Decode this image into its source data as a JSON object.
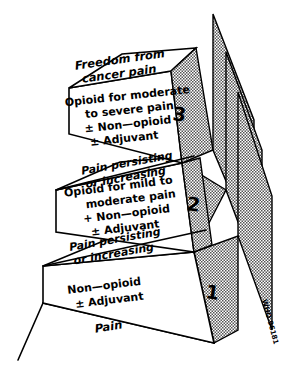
{
  "figure": {
    "goal_label_line1": "Freedom from",
    "goal_label_line2": "cancer pain",
    "base_label": "Pain",
    "credit": "WHO 96181",
    "ink_color": "#000000",
    "paper_color": "#ffffff",
    "shade_color": "#7a7a7a"
  },
  "transitions": [
    {
      "id": "transition-step2",
      "line1": "Pain persisting",
      "line2": "or increasing"
    },
    {
      "id": "transition-step1",
      "line1": "Pain persisting",
      "line2": "or increasing"
    }
  ],
  "steps": [
    {
      "number": "1",
      "name": "step-one",
      "lines": [
        "Non—opioid",
        "± Adjuvant"
      ]
    },
    {
      "number": "2",
      "name": "step-two",
      "lines": [
        "Opioid for mild to",
        "moderate pain",
        "+ Non—opioid",
        "± Adjuvant"
      ]
    },
    {
      "number": "3",
      "name": "step-three",
      "lines": [
        "Opioid for moderate",
        "to severe pain",
        "± Non—opioid",
        "± Adjuvant"
      ]
    }
  ]
}
